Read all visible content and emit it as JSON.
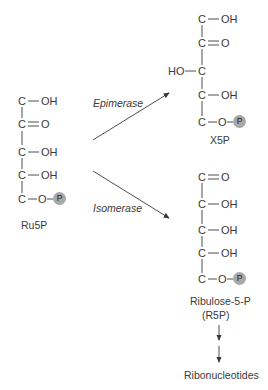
{
  "ru5p": {
    "rows": [
      {
        "left": "",
        "center": "C",
        "right": "OH",
        "bond": "single"
      },
      {
        "left": "",
        "center": "C",
        "right": "O",
        "bond": "double"
      },
      {
        "left": "",
        "center": "C",
        "right": "OH",
        "bond": "single"
      },
      {
        "left": "",
        "center": "C",
        "right": "OH",
        "bond": "single"
      },
      {
        "left": "",
        "center": "C",
        "right": "O",
        "bond": "single",
        "phosphate": "P"
      }
    ],
    "label": "Ru5P"
  },
  "x5p": {
    "rows": [
      {
        "left": "",
        "center": "C",
        "right": "OH",
        "bond": "single"
      },
      {
        "left": "",
        "center": "C",
        "right": "O",
        "bond": "double"
      },
      {
        "left": "HO",
        "center": "C",
        "right": "",
        "bond": "single"
      },
      {
        "left": "",
        "center": "C",
        "right": "OH",
        "bond": "single"
      },
      {
        "left": "",
        "center": "C",
        "right": "O",
        "bond": "single",
        "phosphate": "P"
      }
    ],
    "label": "X5P"
  },
  "r5p": {
    "rows": [
      {
        "left": "",
        "center": "C",
        "right": "O",
        "bond": "double"
      },
      {
        "left": "",
        "center": "C",
        "right": "OH",
        "bond": "single"
      },
      {
        "left": "",
        "center": "C",
        "right": "OH",
        "bond": "single"
      },
      {
        "left": "",
        "center": "C",
        "right": "OH",
        "bond": "single"
      },
      {
        "left": "",
        "center": "C",
        "right": "O",
        "bond": "single",
        "phosphate": "P"
      }
    ],
    "label_line1": "Ribulose-5-P",
    "label_line2": "(R5P)"
  },
  "reactions": {
    "epimerase": "Epimerase",
    "isomerase": "Isomerase"
  },
  "product": "Ribonucleotides",
  "colors": {
    "line": "#3a3a3a",
    "phosphate_fill": "#a8a8a8"
  }
}
